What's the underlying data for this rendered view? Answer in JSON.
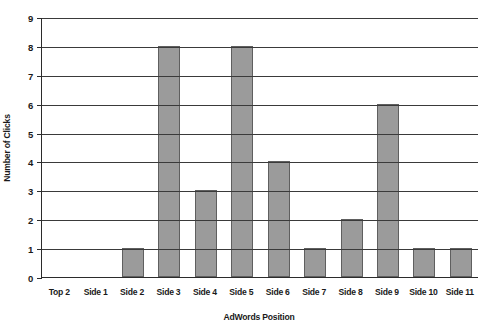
{
  "chart_data": {
    "type": "bar",
    "title": "",
    "xlabel": "AdWords Position",
    "ylabel": "Number of Clicks",
    "categories": [
      "Top 2",
      "Side 1",
      "Side 2",
      "Side 3",
      "Side 4",
      "Side 5",
      "Side 6",
      "Side 7",
      "Side 8",
      "Side 9",
      "Side 10",
      "Side 11"
    ],
    "values": [
      0,
      0,
      1,
      8,
      3,
      8,
      4,
      1,
      2,
      6,
      1,
      1
    ],
    "series": [
      {
        "name": "Number of Clicks",
        "values": [
          0,
          0,
          1,
          8,
          3,
          8,
          4,
          1,
          2,
          6,
          1,
          1
        ]
      }
    ],
    "ylim": [
      0,
      9
    ],
    "yticks": [
      0,
      1,
      2,
      3,
      4,
      5,
      6,
      7,
      8,
      9
    ],
    "ytick_labels": [
      "0",
      "1",
      "2",
      "3",
      "4",
      "5",
      "6",
      "7",
      "8",
      "9"
    ],
    "grid": true,
    "grid_axis": "y",
    "legend": false,
    "legend_position": "none",
    "bar_color": "#9b9b9b",
    "bar_edge_color": "#5f5f5f",
    "axis_color": "#2b2b2b",
    "gridline_color": "#3a3a3a",
    "background_color": "#ffffff",
    "text_color": "#1a1a1a"
  }
}
